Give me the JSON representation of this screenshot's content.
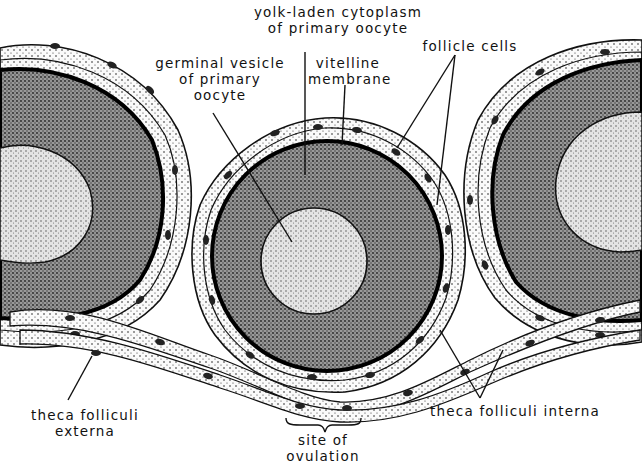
{
  "diagram": {
    "colors": {
      "ink": "#111111",
      "background": "#ffffff",
      "cytoplasm_fill": "#8a8a8a",
      "vesicle_fill": "#dcdcdc",
      "follicle_fill": "#f4f4f4"
    },
    "labels": {
      "yolk": {
        "line1": "yolk-laden cytoplasm",
        "line2": "of primary oocyte"
      },
      "germinal": {
        "line1": "germinal vesicle",
        "line2": "of primary",
        "line3": "oocyte"
      },
      "vitelline": {
        "line1": "vitelline",
        "line2": "membrane"
      },
      "follicle_cells": {
        "line1": "follicle cells"
      },
      "theca_externa": {
        "line1": "theca folliculi",
        "line2": "externa"
      },
      "theca_interna": {
        "line1": "theca folliculi interna"
      },
      "ovulation": {
        "line1": "site of",
        "line2": "ovulation"
      }
    }
  }
}
